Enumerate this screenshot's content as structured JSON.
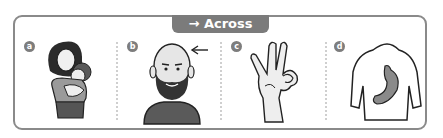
{
  "header": {
    "arrow": "→",
    "label": "Across"
  },
  "panels": [
    {
      "letter": "a",
      "image": "mother-holding-baby"
    },
    {
      "letter": "b",
      "image": "bald-bearded-man-with-arrow-to-forehead"
    },
    {
      "letter": "c",
      "image": "ok-hand-gesture"
    },
    {
      "letter": "d",
      "image": "torso-with-stomach"
    }
  ],
  "colors": {
    "frame": "#8a8a8a",
    "tab": "#7b7b7b",
    "badge": "#7d7d7d",
    "fill_dark": "#6a6a6a",
    "fill_light": "#d9d9d9"
  }
}
